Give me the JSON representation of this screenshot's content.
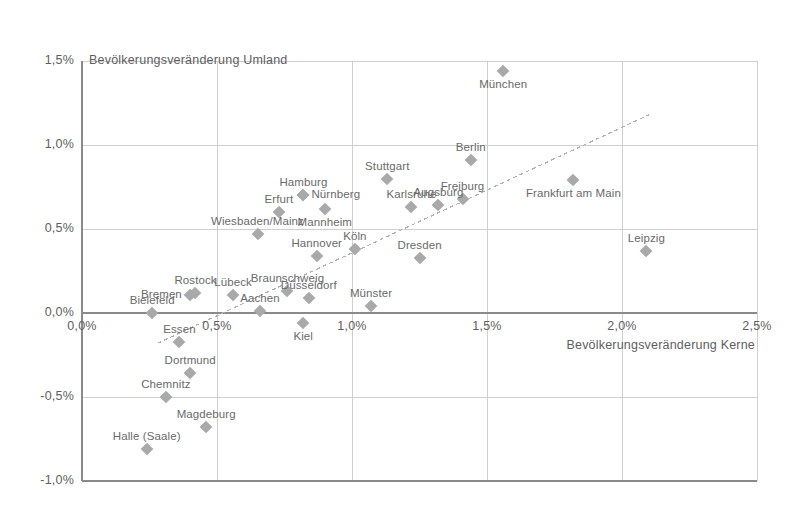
{
  "chart_data": {
    "type": "scatter",
    "title": "",
    "ylabel": "Bevölkerungsveränderung Umland",
    "xlabel": "Bevölkerungsveränderung Kerne",
    "xlim": [
      0.0,
      2.5
    ],
    "ylim": [
      -1.0,
      1.5
    ],
    "xticks": [
      "0,0%",
      "0,5%",
      "1,0%",
      "1,5%",
      "2,0%",
      "2,5%"
    ],
    "yticks": [
      "1,5%",
      "1,0%",
      "0,5%",
      "0,0%",
      "-0,5%",
      "-1,0%"
    ],
    "grid": true,
    "legend": "none",
    "marker_color": "#a9a9a9",
    "grid_color": "#cfcfcf",
    "axis_color": "#8a8a8a",
    "trendline": {
      "style": "dashed",
      "color": "#b0b0b0",
      "x_start": 0.28,
      "y_start": -0.18,
      "x_end": 2.1,
      "y_end": 1.18
    },
    "points": [
      {
        "label": "München",
        "x": 1.56,
        "y": 1.44,
        "label_pos": "below"
      },
      {
        "label": "Berlin",
        "x": 1.44,
        "y": 0.91,
        "label_pos": "above"
      },
      {
        "label": "Stuttgart",
        "x": 1.13,
        "y": 0.8,
        "label_pos": "above"
      },
      {
        "label": "Frankfurt am Main",
        "x": 1.82,
        "y": 0.79,
        "label_pos": "below"
      },
      {
        "label": "Hamburg",
        "x": 0.82,
        "y": 0.7,
        "label_pos": "above"
      },
      {
        "label": "Nürnberg",
        "x": 0.82,
        "y": 0.7,
        "label_pos": "right"
      },
      {
        "label": "Freiburg",
        "x": 1.41,
        "y": 0.68,
        "label_pos": "above"
      },
      {
        "label": "Augsburg",
        "x": 1.32,
        "y": 0.64,
        "label_pos": "above"
      },
      {
        "label": "Karlsruhe",
        "x": 1.22,
        "y": 0.63,
        "label_pos": "above"
      },
      {
        "label": "Mannheim",
        "x": 0.9,
        "y": 0.62,
        "label_pos": "below"
      },
      {
        "label": "Erfurt",
        "x": 0.73,
        "y": 0.6,
        "label_pos": "above"
      },
      {
        "label": "Wiesbaden/Mainz",
        "x": 0.65,
        "y": 0.47,
        "label_pos": "above"
      },
      {
        "label": "Köln",
        "x": 1.01,
        "y": 0.38,
        "label_pos": "above"
      },
      {
        "label": "Leipzig",
        "x": 2.09,
        "y": 0.37,
        "label_pos": "above"
      },
      {
        "label": "Hannover",
        "x": 0.87,
        "y": 0.34,
        "label_pos": "above"
      },
      {
        "label": "Dresden",
        "x": 1.25,
        "y": 0.33,
        "label_pos": "above"
      },
      {
        "label": "Braunschweig",
        "x": 0.76,
        "y": 0.13,
        "label_pos": "above"
      },
      {
        "label": "Rostock",
        "x": 0.42,
        "y": 0.12,
        "label_pos": "above"
      },
      {
        "label": "Bremen",
        "x": 0.4,
        "y": 0.11,
        "label_pos": "left"
      },
      {
        "label": "Lübeck",
        "x": 0.56,
        "y": 0.11,
        "label_pos": "above"
      },
      {
        "label": "Düsseldorf",
        "x": 0.84,
        "y": 0.09,
        "label_pos": "above"
      },
      {
        "label": "Münster",
        "x": 1.07,
        "y": 0.04,
        "label_pos": "above"
      },
      {
        "label": "Aachen",
        "x": 0.66,
        "y": 0.01,
        "label_pos": "above"
      },
      {
        "label": "Bielefeld",
        "x": 0.26,
        "y": 0.0,
        "label_pos": "above"
      },
      {
        "label": "Kiel",
        "x": 0.82,
        "y": -0.06,
        "label_pos": "below"
      },
      {
        "label": "Essen",
        "x": 0.36,
        "y": -0.17,
        "label_pos": "above"
      },
      {
        "label": "Dortmund",
        "x": 0.4,
        "y": -0.36,
        "label_pos": "above"
      },
      {
        "label": "Chemnitz",
        "x": 0.31,
        "y": -0.5,
        "label_pos": "above"
      },
      {
        "label": "Magdeburg",
        "x": 0.46,
        "y": -0.68,
        "label_pos": "above"
      },
      {
        "label": "Halle (Saale)",
        "x": 0.24,
        "y": -0.81,
        "label_pos": "above"
      }
    ]
  },
  "axes": {
    "y_axis_title": "Bevölkerungsveränderung Umland",
    "x_axis_title": "Bevölkerungsveränderung Kerne",
    "x_tick_labels": [
      "0,0%",
      "0,5%",
      "1,0%",
      "1,5%",
      "2,0%",
      "2,5%"
    ],
    "y_tick_labels": [
      "1,5%",
      "1,0%",
      "0,5%",
      "0,0%",
      "-0,5%",
      "-1,0%"
    ]
  }
}
